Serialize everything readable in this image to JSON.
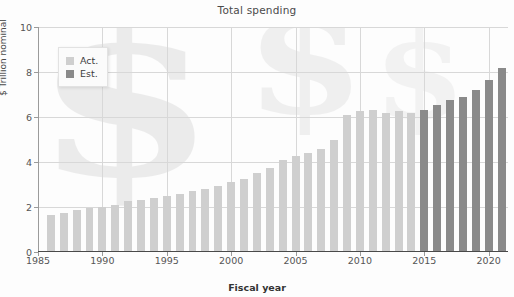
{
  "chart_data": {
    "type": "bar",
    "title": "Total spending",
    "xlabel": "Fiscal year",
    "ylabel": "$ Trillion nominal",
    "ylim": [
      0,
      10
    ],
    "xlim": [
      1985,
      2021.5
    ],
    "grid": true,
    "legend_position": "upper-left",
    "ytick_labels": [
      "0",
      "2",
      "4",
      "6",
      "8",
      "10"
    ],
    "ytick_values": [
      0,
      2,
      4,
      6,
      8,
      10
    ],
    "xtick_labels": [
      "1985",
      "1990",
      "1995",
      "2000",
      "2005",
      "2010",
      "2015",
      "2020"
    ],
    "xtick_values": [
      1985,
      1990,
      1995,
      2000,
      2005,
      2010,
      2015,
      2020
    ],
    "series": [
      {
        "name": "Act.",
        "color": "#cfcfcf"
      },
      {
        "name": "Est.",
        "color": "#8a8a8a"
      }
    ],
    "categories": [
      1986,
      1987,
      1988,
      1989,
      1990,
      1991,
      1992,
      1993,
      1994,
      1995,
      1996,
      1997,
      1998,
      1999,
      2000,
      2001,
      2002,
      2003,
      2004,
      2005,
      2006,
      2007,
      2008,
      2009,
      2010,
      2011,
      2012,
      2013,
      2014,
      2015,
      2016,
      2017,
      2018,
      2019,
      2020,
      2021
    ],
    "values": [
      1.65,
      1.75,
      1.85,
      1.95,
      2.0,
      2.1,
      2.25,
      2.3,
      2.4,
      2.5,
      2.6,
      2.7,
      2.8,
      2.95,
      3.1,
      3.25,
      3.5,
      3.75,
      4.1,
      4.25,
      4.4,
      4.6,
      5.0,
      6.1,
      6.25,
      6.3,
      6.2,
      6.25,
      6.2,
      6.3,
      6.55,
      6.75,
      6.9,
      7.2,
      7.65,
      8.2
    ],
    "kinds": [
      "act",
      "act",
      "act",
      "act",
      "act",
      "act",
      "act",
      "act",
      "act",
      "act",
      "act",
      "act",
      "act",
      "act",
      "act",
      "act",
      "act",
      "act",
      "act",
      "act",
      "act",
      "act",
      "act",
      "act",
      "act",
      "act",
      "act",
      "act",
      "act",
      "est",
      "est",
      "est",
      "est",
      "est",
      "est",
      "est"
    ]
  }
}
